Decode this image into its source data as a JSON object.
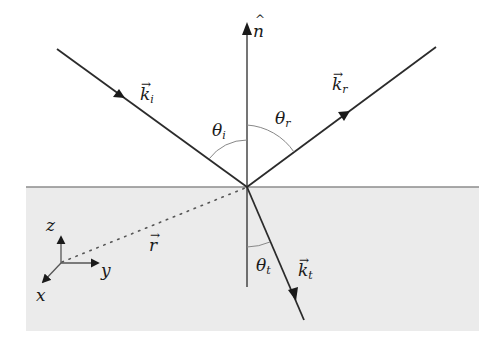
{
  "figure": {
    "colors": {
      "background": "#ffffff",
      "medium": "#ebebeb",
      "interface_line": "#8c8c8c",
      "ray": "#2b2b2b",
      "angle_arc": "#888888"
    },
    "labels": {
      "normal": {
        "base": "n",
        "accent": "^"
      },
      "incident_wave": {
        "base": "k",
        "sub": "i",
        "accent": "→"
      },
      "reflected_wave": {
        "base": "k",
        "sub": "r",
        "accent": "→"
      },
      "transmitted_wave": {
        "base": "k",
        "sub": "t",
        "accent": "→"
      },
      "position_vector": {
        "base": "r",
        "accent": "→"
      },
      "angle_incidence": {
        "base": "θ",
        "sub": "i"
      },
      "angle_reflection": {
        "base": "θ",
        "sub": "r"
      },
      "angle_transmission": {
        "base": "θ",
        "sub": "t"
      },
      "axis_x": "x",
      "axis_y": "y",
      "axis_z": "z"
    }
  }
}
